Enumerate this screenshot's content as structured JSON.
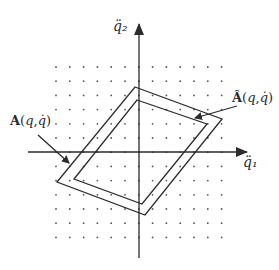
{
  "axes": {
    "x_label": "q̈₁",
    "y_label": "q̈₂"
  },
  "labels": {
    "outer_set": "A(q,q̇)",
    "inner_set": "Â(q,q̇)"
  },
  "grid": {
    "rows": 13,
    "cols": 13,
    "x0": 56,
    "y0": 67,
    "dx": 13.8,
    "dy": 14.2
  },
  "colors": {
    "stroke": "#2b2b2b",
    "dot": "#555555",
    "background": "#ffffff"
  },
  "outer_polygon": [
    [
      135,
      87
    ],
    [
      222,
      119
    ],
    [
      145,
      215
    ],
    [
      57,
      182
    ]
  ],
  "inner_polygon": [
    [
      137,
      100
    ],
    [
      207,
      124
    ],
    [
      142,
      204
    ],
    [
      74,
      179
    ]
  ]
}
